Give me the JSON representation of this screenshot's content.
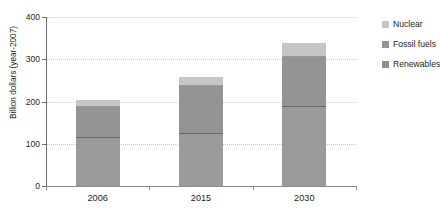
{
  "chart_data": {
    "type": "bar",
    "subtype": "stacked-bar",
    "title": "in the Reference Scenario",
    "xlabel": "",
    "ylabel": "Billion dollars (year-2007)",
    "ylim": [
      0,
      400
    ],
    "yticks": [
      0,
      100,
      200,
      300,
      400
    ],
    "ytick_labels": [
      "0",
      "100",
      "200",
      "300",
      "400"
    ],
    "categories": [
      "2006",
      "2015",
      "2030"
    ],
    "grid": true,
    "grid_axis": "y",
    "legend_position": "right",
    "series": [
      {
        "name": "Renewables",
        "color": "#9b9b9b",
        "values": [
          115,
          126,
          190
        ]
      },
      {
        "name": "Fossil fuels",
        "color": "#949494",
        "values": [
          74,
          112,
          118
        ]
      },
      {
        "name": "Nuclear",
        "color": "#c6c6c6",
        "values": [
          15,
          19,
          30
        ]
      }
    ],
    "totals": [
      204,
      257,
      338
    ],
    "stack_order": [
      "Renewables",
      "Fossil fuels",
      "Nuclear"
    ]
  },
  "legend": {
    "items": [
      {
        "label": "Nuclear",
        "color": "#c6c6c6"
      },
      {
        "label": "Fossil fuels",
        "color": "#949494"
      },
      {
        "label": "Renewables",
        "color": "#8f8f8f"
      }
    ]
  },
  "colors": {
    "nuclear": "#c6c6c6",
    "fossil_fuels": "#949494",
    "renewables": "#9b9b9b",
    "axis": "#8a8a8a",
    "gridline": "#c9c9c9",
    "text": "#231f20",
    "background": "#ffffff"
  }
}
